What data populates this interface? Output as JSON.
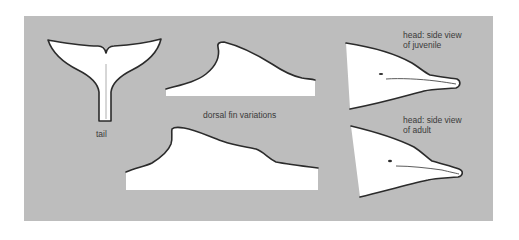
{
  "figure": {
    "type": "anatomy-illustration",
    "panel_color": "#bdbdbd",
    "shape_fill": "#ffffff",
    "outline_color": "#2b2b2b"
  },
  "labels": {
    "tail": "tail",
    "dorsal_fin": "dorsal fin variations",
    "head_juvenile_line1": "head: side view",
    "head_juvenile_line2": "of juvenile",
    "head_adult_line1": "head: side view",
    "head_adult_line2": "of adult"
  },
  "illustrations": [
    {
      "id": "tail",
      "label_key": "tail"
    },
    {
      "id": "dorsal-fin-1",
      "label_key": "dorsal_fin"
    },
    {
      "id": "dorsal-fin-2",
      "label_key": "dorsal_fin"
    },
    {
      "id": "head-juvenile",
      "label_key": "head_juvenile"
    },
    {
      "id": "head-adult",
      "label_key": "head_adult"
    }
  ]
}
